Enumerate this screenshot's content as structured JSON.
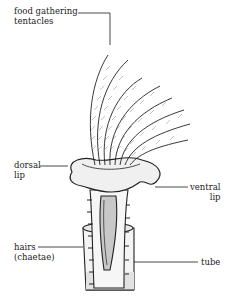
{
  "diagram": {
    "labels": {
      "tentacles_line1": "food gathering",
      "tentacles_line2": "tentacles",
      "dorsal_line1": "dorsal",
      "dorsal_line2": "lip",
      "ventral_line1": "ventral",
      "ventral_line2": "lip",
      "hairs_line1": "hairs",
      "hairs_line2": "(chaetae)",
      "tube": "tube"
    },
    "colors": {
      "ink": "#222222",
      "body_fill": "#f2f2f2",
      "shade": "#bbbbbb",
      "background": "#ffffff"
    }
  }
}
